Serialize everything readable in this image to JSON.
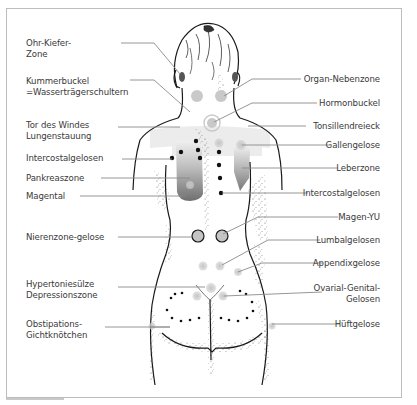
{
  "figure": {
    "left_labels": [
      {
        "id": "ohr-kiefer-zone",
        "text": "Ohr-Kiefer-\nZone"
      },
      {
        "id": "kummerbuckel",
        "text": "Kummerbuckel\n=Wasserträgerschultern"
      },
      {
        "id": "tor-des-windes",
        "text": "Tor des Windes\nLungenstauung"
      },
      {
        "id": "intercostalgelosen-left",
        "text": "Intercostalgelosen"
      },
      {
        "id": "pankreaszone",
        "text": "Pankreaszone"
      },
      {
        "id": "magental",
        "text": "Magental"
      },
      {
        "id": "nierenzone-gelose",
        "text": "Nierenzone-gelose"
      },
      {
        "id": "hypertoniesulze",
        "text": "Hypertoniesülze\nDepressionszone"
      },
      {
        "id": "obstipations",
        "text": "Obstipations-\nGichtknötchen"
      }
    ],
    "right_labels": [
      {
        "id": "organ-nebenzone",
        "text": "Organ-Nebenzone"
      },
      {
        "id": "hormonbuckel",
        "text": "Hormonbuckel"
      },
      {
        "id": "tonsillendreieck",
        "text": "Tonsillendreieck"
      },
      {
        "id": "gallengelose",
        "text": "Gallengelose"
      },
      {
        "id": "leberzone",
        "text": "Leberzone"
      },
      {
        "id": "intercostalgelosen-right",
        "text": "Intercostalgelosen"
      },
      {
        "id": "magen-yu",
        "text": "Magen-YU"
      },
      {
        "id": "lumbalgelosen",
        "text": "Lumbalgelosen"
      },
      {
        "id": "appendixgelose",
        "text": "Appendixgelose"
      },
      {
        "id": "ovarial-genital",
        "text": "Ovarial-Genital-\nGelosen"
      },
      {
        "id": "huftgelose",
        "text": "Hüftgelose"
      }
    ],
    "colors": {
      "line": "#8a8a8a",
      "outline": "#1a1a1a",
      "zone_gray": "#bdbdbd",
      "dark_zone": "#7a7a7a",
      "dot": "#111111",
      "text": "#3a3a3a",
      "frame": "#bdbdbd"
    }
  }
}
